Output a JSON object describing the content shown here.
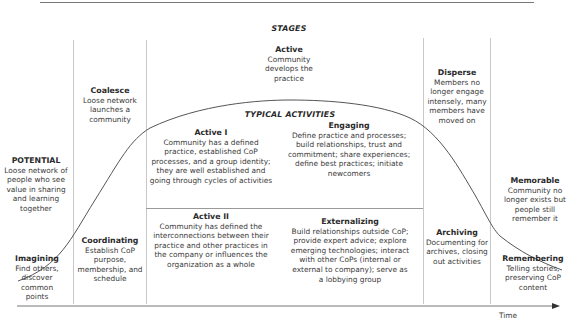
{
  "header": {
    "stages_title": "STAGES",
    "activities_title": "TYPICAL ACTIVITIES"
  },
  "stages": [
    {
      "name": "POTENTIAL",
      "desc": "Loose network of people who see value in sharing and learning together"
    },
    {
      "name": "Coalesce",
      "desc": "Loose network launches a community"
    },
    {
      "name": "Active",
      "desc": "Community develops the practice"
    },
    {
      "name": "Disperse",
      "desc": "Members no longer engage intensely, many members have moved on"
    },
    {
      "name": "Memorable",
      "desc": "Community no longer exists but people still remember it"
    }
  ],
  "active_substages": [
    {
      "name": "Active I",
      "desc": "Community has a defined practice, established CoP processes, and a group identity; they are well established and going through cycles of activities"
    },
    {
      "name": "Active II",
      "desc": "Community has defined the interconnections between their practice and other practices in the company or influences the organization as a whole"
    }
  ],
  "activities": [
    {
      "name": "Imagining",
      "desc": "Find others, discover common points"
    },
    {
      "name": "Coordinating",
      "desc": "Establish CoP purpose, membership, and schedule"
    },
    {
      "name": "Engaging",
      "desc": "Define practice and processes; build relationships, trust and commitment; share experiences; define best practices; initiate newcomers"
    },
    {
      "name": "Externalizing",
      "desc": "Build relationships outside CoP; provide expert advice; explore emerging technologies; interact with other CoPs (internal or external to company); serve as a lobbying group"
    },
    {
      "name": "Archiving",
      "desc": "Documenting for archives, closing out activities"
    },
    {
      "name": "Remembering",
      "desc": "Telling stories, preserving CoP content"
    }
  ],
  "axis": {
    "label": "Time"
  },
  "colors": {
    "line": "#555555",
    "divider": "#c8c8c8",
    "text": "#3a3a3a"
  }
}
